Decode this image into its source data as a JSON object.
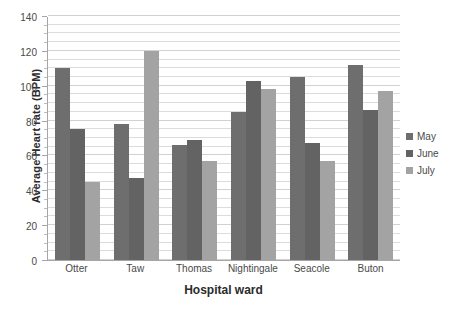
{
  "chart_data": {
    "type": "bar",
    "title": "",
    "xlabel": "Hospital ward",
    "ylabel": "Average Heart rate (BPM)",
    "categories": [
      "Otter",
      "Taw",
      "Thomas",
      "Nightingale",
      "Seacole",
      "Buton"
    ],
    "series": [
      {
        "name": "May",
        "color": "#6e6e6e",
        "values": [
          110,
          78,
          66,
          85,
          105,
          112
        ]
      },
      {
        "name": "June",
        "color": "#636363",
        "values": [
          75,
          47,
          69,
          103,
          67,
          86
        ]
      },
      {
        "name": "July",
        "color": "#a3a3a3",
        "values": [
          45,
          120,
          57,
          98,
          57,
          97
        ]
      }
    ],
    "ylim": [
      0,
      140
    ],
    "ytick_step": 20,
    "yticks": [
      0,
      20,
      40,
      60,
      80,
      100,
      120,
      140
    ],
    "ytick_labels": [
      "0",
      "20",
      "40",
      "60",
      "80",
      "100",
      "120",
      "140"
    ],
    "minor_tick_step": 5,
    "grid": true,
    "grid_axis": "y",
    "legend_position": "right",
    "legend_entries": [
      "May",
      "June",
      "July"
    ]
  }
}
